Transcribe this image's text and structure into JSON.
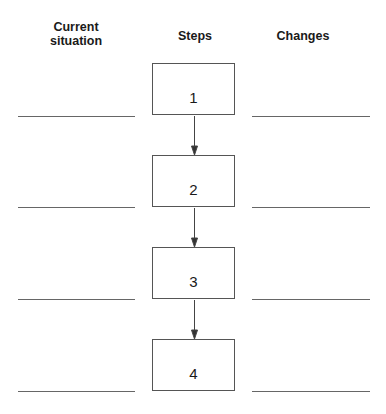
{
  "headers": {
    "current_line1": "Current",
    "current_line2": "situation",
    "steps": "Steps",
    "changes": "Changes"
  },
  "steps": [
    {
      "label": "1"
    },
    {
      "label": "2"
    },
    {
      "label": "3"
    },
    {
      "label": "4"
    }
  ],
  "colors": {
    "line": "#666666",
    "box_border": "#555555",
    "text": "#1a1a1a"
  }
}
